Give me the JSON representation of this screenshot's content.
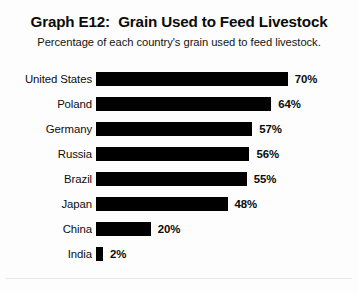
{
  "chart_data": {
    "type": "bar",
    "orientation": "horizontal",
    "title": "Graph E12:  Grain Used to Feed Livestock",
    "subtitle": "Percentage of each country's grain used to feed livestock.",
    "xlabel": "",
    "ylabel": "",
    "xlim": [
      0,
      70
    ],
    "grid": false,
    "legend": null,
    "value_suffix": "%",
    "bar_color": "#000000",
    "background_color": "#ffffff",
    "text_color": "#0b0b0b",
    "categories": [
      "United States",
      "Poland",
      "Germany",
      "Russia",
      "Brazil",
      "Japan",
      "China",
      "India"
    ],
    "values": [
      70,
      64,
      57,
      56,
      55,
      48,
      20,
      2
    ],
    "value_labels": [
      "70%",
      "64%",
      "57%",
      "56%",
      "55%",
      "48%",
      "20%",
      "2%"
    ]
  }
}
